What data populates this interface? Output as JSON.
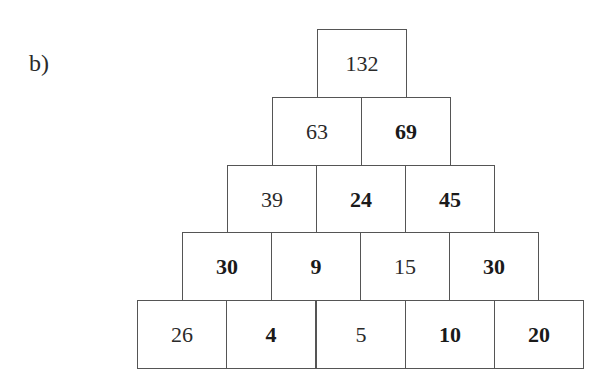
{
  "label": "b)",
  "pyramid": {
    "rows": [
      [
        {
          "value": "132",
          "bold": false
        }
      ],
      [
        {
          "value": "63",
          "bold": false
        },
        {
          "value": "69",
          "bold": true
        }
      ],
      [
        {
          "value": "39",
          "bold": false
        },
        {
          "value": "24",
          "bold": true
        },
        {
          "value": "45",
          "bold": true
        }
      ],
      [
        {
          "value": "30",
          "bold": true
        },
        {
          "value": "9",
          "bold": true
        },
        {
          "value": "15",
          "bold": false
        },
        {
          "value": "30",
          "bold": true
        }
      ],
      [
        {
          "value": "26",
          "bold": false
        },
        {
          "value": "4",
          "bold": true
        },
        {
          "value": "5",
          "bold": false
        },
        {
          "value": "10",
          "bold": true
        },
        {
          "value": "20",
          "bold": true
        }
      ]
    ]
  }
}
